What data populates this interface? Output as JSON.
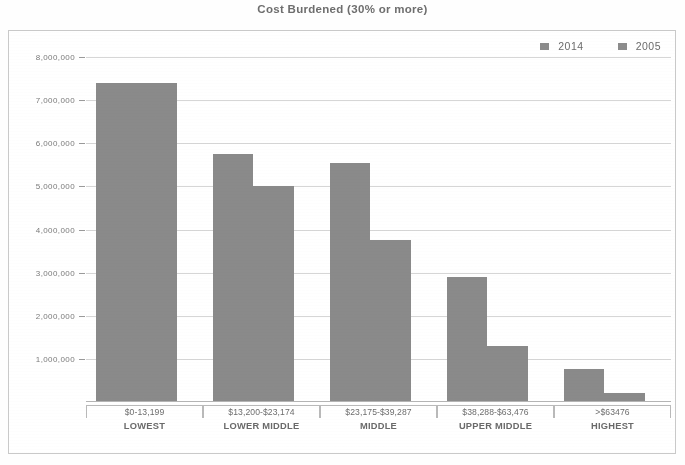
{
  "chart_data": {
    "type": "bar",
    "title": "Cost Burdened (30% or more)",
    "xlabel": "",
    "ylabel": "",
    "ylim": [
      0,
      8000000
    ],
    "grid": true,
    "legend_position": "top-right",
    "categories": [
      "$0-13,199",
      "$13,200-$23,174",
      "$23,175-$39,287",
      "$38,288-$63,476",
      ">$63476"
    ],
    "category_names": [
      "LOWEST",
      "LOWER MIDDLE",
      "MIDDLE",
      "UPPER MIDDLE",
      "HIGHEST"
    ],
    "ytick_labels": [
      "1,000,000",
      "2,000,000",
      "3,000,000",
      "4,000,000",
      "5,000,000",
      "6,000,000",
      "7,000,000",
      "8,000,000"
    ],
    "ytick_values": [
      1000000,
      2000000,
      3000000,
      4000000,
      5000000,
      6000000,
      7000000,
      8000000
    ],
    "series": [
      {
        "name": "2014",
        "color": "#8a8a8a",
        "values": [
          7400000,
          5750000,
          5550000,
          2900000,
          760000
        ]
      },
      {
        "name": "2005",
        "color": "#8a8a8a",
        "values": [
          7400000,
          5000000,
          3750000,
          1300000,
          200000
        ]
      }
    ]
  },
  "legend": {
    "items": [
      {
        "label": "2014"
      },
      {
        "label": "2005"
      }
    ]
  }
}
